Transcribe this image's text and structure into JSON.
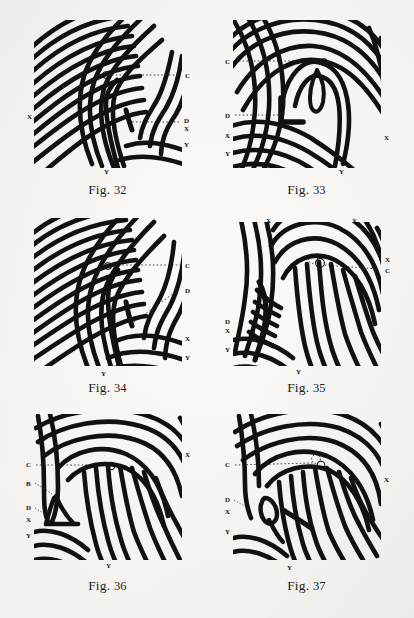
{
  "page": {
    "background_color": "#f3f2ef",
    "ink_color": "#111010",
    "type": "plate of fingerprint pattern diagrams"
  },
  "figures": [
    {
      "id": "fig32",
      "caption": "Fig. 32",
      "caption_prefix": "Fig.",
      "caption_number": "32",
      "pattern": "loop",
      "labels": [
        {
          "text": "C",
          "side": "right",
          "x": 163,
          "y": 62
        },
        {
          "text": "D",
          "side": "right",
          "x": 163,
          "y": 106
        },
        {
          "text": "X",
          "side": "right",
          "x": 163,
          "y": 114
        },
        {
          "text": "Y",
          "side": "right",
          "x": 163,
          "y": 130
        },
        {
          "text": "X",
          "side": "left",
          "x": 6,
          "y": 103
        },
        {
          "text": "Y",
          "side": "bottom",
          "x": 84,
          "y": 158
        }
      ],
      "core_marker": "small-circle",
      "guide_lines": [
        "C",
        "D"
      ]
    },
    {
      "id": "fig33",
      "caption": "Fig. 33",
      "caption_prefix": "Fig.",
      "caption_number": "33",
      "pattern": "loop",
      "labels": [
        {
          "text": "C",
          "side": "left",
          "x": 6,
          "y": 48
        },
        {
          "text": "D",
          "side": "left",
          "x": 6,
          "y": 102
        },
        {
          "text": "X",
          "side": "left",
          "x": 6,
          "y": 122
        },
        {
          "text": "Y",
          "side": "left",
          "x": 6,
          "y": 140
        },
        {
          "text": "X",
          "side": "right",
          "x": 164,
          "y": 124
        },
        {
          "text": "Y",
          "side": "bottom",
          "x": 120,
          "y": 158
        }
      ],
      "core_marker": "small-circle",
      "guide_lines": [
        "C",
        "D"
      ]
    },
    {
      "id": "fig34",
      "caption": "Fig. 34",
      "caption_prefix": "Fig.",
      "caption_number": "34",
      "pattern": "loop",
      "labels": [
        {
          "text": "C",
          "side": "right",
          "x": 163,
          "y": 53
        },
        {
          "text": "D",
          "side": "right",
          "x": 163,
          "y": 78
        },
        {
          "text": "X",
          "side": "right",
          "x": 163,
          "y": 126
        },
        {
          "text": "Y",
          "side": "right",
          "x": 163,
          "y": 145
        },
        {
          "text": "Y",
          "side": "bottom",
          "x": 81,
          "y": 162
        }
      ],
      "core_marker": "small-circle",
      "guide_lines": [
        "C",
        "D"
      ]
    },
    {
      "id": "fig35",
      "caption": "Fig. 35",
      "caption_prefix": "Fig.",
      "caption_number": "35",
      "pattern": "loop",
      "labels": [
        {
          "text": "X",
          "side": "top",
          "x": 47,
          "y": 9
        },
        {
          "text": "X",
          "side": "top",
          "x": 133,
          "y": 9
        },
        {
          "text": "X",
          "side": "right",
          "x": 164,
          "y": 48
        },
        {
          "text": "C",
          "side": "right",
          "x": 164,
          "y": 58
        },
        {
          "text": "D",
          "side": "left",
          "x": 6,
          "y": 110
        },
        {
          "text": "X",
          "side": "left",
          "x": 6,
          "y": 118
        },
        {
          "text": "Y",
          "side": "left",
          "x": 6,
          "y": 137
        },
        {
          "text": "Y",
          "side": "bottom",
          "x": 77,
          "y": 160
        }
      ],
      "core_marker": "dotted-circle",
      "guide_lines": [
        "C"
      ]
    },
    {
      "id": "fig36",
      "caption": "Fig. 36",
      "caption_prefix": "Fig.",
      "caption_number": "36",
      "pattern": "loop",
      "labels": [
        {
          "text": "C",
          "side": "left",
          "x": 6,
          "y": 55
        },
        {
          "text": "B",
          "side": "left",
          "x": 6,
          "y": 74
        },
        {
          "text": "D",
          "side": "left",
          "x": 6,
          "y": 98
        },
        {
          "text": "X",
          "side": "left",
          "x": 6,
          "y": 110
        },
        {
          "text": "Y",
          "side": "left",
          "x": 6,
          "y": 126
        },
        {
          "text": "X",
          "side": "right",
          "x": 164,
          "y": 45
        },
        {
          "text": "Y",
          "side": "bottom",
          "x": 86,
          "y": 156
        }
      ],
      "core_marker": "small-circle",
      "guide_lines": [
        "C"
      ]
    },
    {
      "id": "fig37",
      "caption": "Fig. 37",
      "caption_prefix": "Fig.",
      "caption_number": "37",
      "pattern": "loop",
      "labels": [
        {
          "text": "C",
          "side": "left",
          "x": 6,
          "y": 55
        },
        {
          "text": "D",
          "side": "left",
          "x": 6,
          "y": 90
        },
        {
          "text": "X",
          "side": "left",
          "x": 6,
          "y": 102
        },
        {
          "text": "Y",
          "side": "left",
          "x": 6,
          "y": 122
        },
        {
          "text": "X",
          "side": "right",
          "x": 164,
          "y": 70
        },
        {
          "text": "Y",
          "side": "bottom",
          "x": 68,
          "y": 158
        }
      ],
      "core_marker": "dotted-circle",
      "guide_lines": [
        "C"
      ]
    }
  ]
}
